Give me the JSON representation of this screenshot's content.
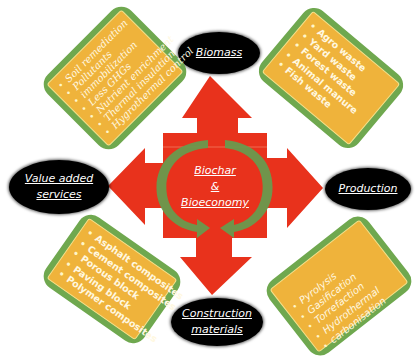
{
  "diagram": {
    "center": {
      "title_line1": "Biochar",
      "title_line2": "&",
      "title_line3": "Bioeconomy"
    },
    "nodes": {
      "top": {
        "label": "Biomass"
      },
      "right": {
        "label": "Production"
      },
      "bottom": {
        "line1": "Construction",
        "line2": "materials"
      },
      "left": {
        "line1": "Value added",
        "line2": "services"
      }
    },
    "cards": {
      "top_left": {
        "topic": "Value added services",
        "items": [
          "Soil remediation",
          "Pollutants",
          "immobilization",
          "Less GHGs",
          "Nutrient enrichment",
          "Thermal insulation",
          "Hygrothermal control"
        ]
      },
      "top_right": {
        "topic": "Biomass",
        "items": [
          "Agro waste",
          "Yard waste",
          "Forest waste",
          "Animal manure",
          "Fish waste"
        ]
      },
      "bottom_left": {
        "topic": "Construction materials",
        "items": [
          "Asphalt composites",
          "Cement composites",
          "Porous block",
          "Paving block",
          "Polymer composites"
        ]
      },
      "bottom_right": {
        "topic": "Production",
        "items": [
          "Pyrolysis",
          "Gasification",
          "Torrefaction",
          "Hydrothermal",
          "carbonisation"
        ]
      }
    },
    "colors": {
      "arrow_red": "#e8321c",
      "cycle_green": "#6a9a4e",
      "card_border_green": "#6fa84f",
      "card_fill_orange": "#efb33b",
      "node_black": "#000000",
      "text_white": "#ffffff"
    }
  }
}
